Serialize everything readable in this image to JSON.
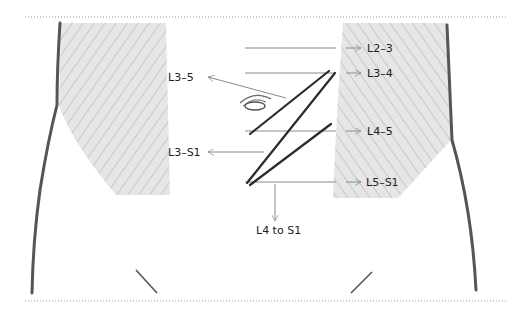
{
  "figure": {
    "colors": {
      "outline": "#555555",
      "hatch_fill": "#e4e4e4",
      "hatch_line": "#9a9a9a",
      "leader_line": "#8a8a8a",
      "incision": "#2b2b2b",
      "text": "#222222",
      "border_dots": "#9a9a9a"
    },
    "right_labels": [
      {
        "text": "L2–3",
        "y": 48
      },
      {
        "text": "L3–4",
        "y": 73
      },
      {
        "text": "L4–5",
        "y": 131
      },
      {
        "text": "L5–S1",
        "y": 182
      }
    ],
    "left_labels": [
      {
        "text": "L3–5",
        "y": 77
      },
      {
        "text": "L3–S1",
        "y": 152
      }
    ],
    "bottom_label": {
      "text": "L4 to S1"
    },
    "navel_icon": "umbilicus",
    "arrow_glyph": "arrow"
  }
}
